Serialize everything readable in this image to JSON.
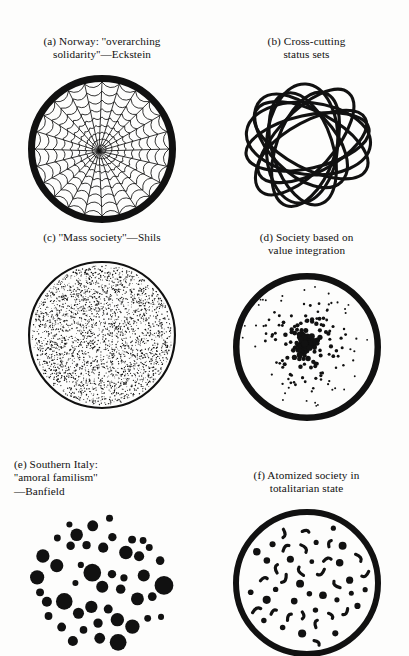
{
  "figure": {
    "background_color": "#fdfdfc",
    "ink_color": "#111111",
    "columns": 2,
    "rows": 3
  },
  "panels": [
    {
      "id": "a",
      "label": "(a)",
      "caption": "(a) Norway: ''overarching\nsolidarity''—Eckstein",
      "caption_lines": [
        "(a) Norway: ''overarching",
        "solidarity''—Eckstein"
      ],
      "diagram": "spider-web-circle",
      "has_outer_circle": true,
      "outer_circle_stroke": 7,
      "radial_spokes": 24,
      "concentric_rings": 9,
      "web_sag": 0.14,
      "web_stroke": 0.85,
      "size": 150
    },
    {
      "id": "b",
      "label": "(b)",
      "caption": "(b) Cross-cutting\nstatus sets",
      "caption_lines": [
        "(b) Cross-cutting",
        "status sets"
      ],
      "diagram": "overlapping-ellipses",
      "has_outer_circle": false,
      "ellipse_count": 9,
      "ellipse_stroke": 3.1,
      "size": 150
    },
    {
      "id": "c",
      "label": "(c)",
      "caption": "(c) ''Mass society''—Shils",
      "caption_lines": [
        "(c) ''Mass society''—Shils"
      ],
      "diagram": "fine-stipple-circle",
      "has_outer_circle": true,
      "outer_circle_stroke": 2.1,
      "dot_count": 2600,
      "dot_radius": 0.55,
      "distribution": "uniform",
      "size": 150
    },
    {
      "id": "d",
      "label": "(d)",
      "caption": "(d) Society based on\nvalue integration",
      "caption_lines": [
        "(d) Society based on",
        "value integration"
      ],
      "diagram": "center-clustered-dots-circle",
      "has_outer_circle": true,
      "outer_circle_stroke": 6.5,
      "dot_count": 230,
      "distribution": "center-dense",
      "dot_radius_center": 3.0,
      "dot_radius_edge": 0.9,
      "size": 150
    },
    {
      "id": "e",
      "label": "(e)",
      "caption": "(e) Southern Italy:\n''amoral familism''\n—Banfield",
      "caption_lines": [
        "(e) Southern Italy:",
        "''amoral familism''",
        "—Banfield"
      ],
      "diagram": "large-blob-cluster",
      "has_outer_circle": false,
      "blob_count": 46,
      "blob_radius_min": 3.0,
      "blob_radius_max": 14.5,
      "size": 150
    },
    {
      "id": "f",
      "label": "(f)",
      "caption": "(f) Atomized society in\ntotalitarian state",
      "caption_lines": [
        "(f) Atomized society in",
        "totalitarian state"
      ],
      "diagram": "scattered-dots-and-commas-circle",
      "has_outer_circle": true,
      "outer_circle_stroke": 6.0,
      "dot_count": 26,
      "comma_count": 22,
      "distribution": "uniform-sparse",
      "size": 150
    }
  ]
}
